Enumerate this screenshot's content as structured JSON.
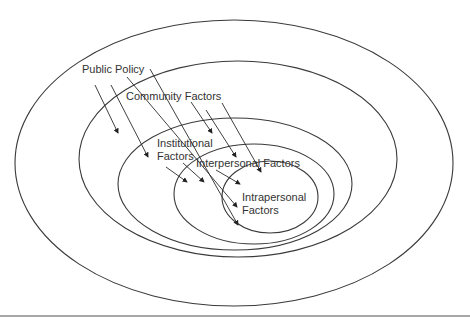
{
  "diagram": {
    "type": "nested-ellipses",
    "levels": [
      {
        "label": "Public Policy",
        "lines": [
          "Public Policy"
        ]
      },
      {
        "label": "Community Factors",
        "lines": [
          "Community Factors"
        ]
      },
      {
        "label": "Institutional Factors",
        "lines": [
          "Institutional",
          "Factors"
        ]
      },
      {
        "label": "Interpersonal Factors",
        "lines": [
          "Interpersonal Factors"
        ]
      },
      {
        "label": "Intrapersonal Factors",
        "lines": [
          "Intrapersonal",
          "Factors"
        ]
      }
    ],
    "colors": {
      "stroke": "#3a3a3a",
      "text": "#333333",
      "background": "#ffffff",
      "rule": "#8a8a8a"
    }
  }
}
